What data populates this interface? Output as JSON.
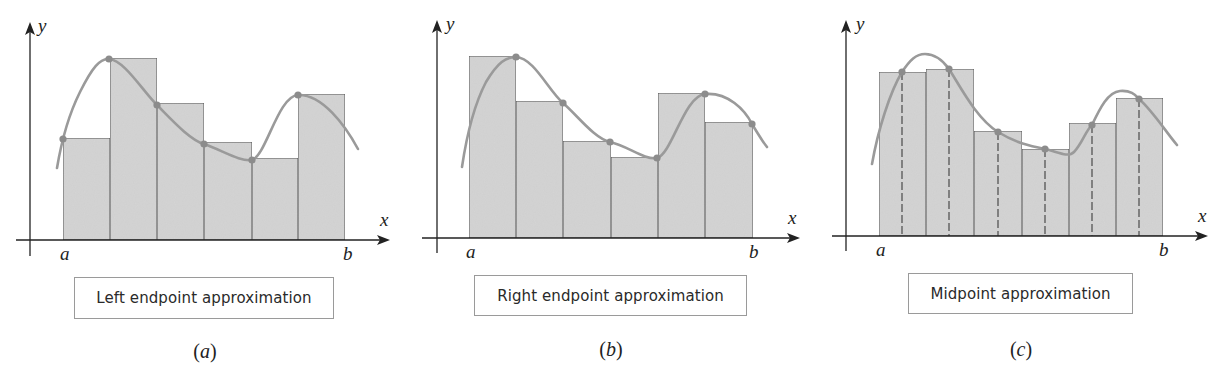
{
  "figure": {
    "panels": [
      {
        "id": "a",
        "caption": "Left endpoint approximation",
        "label_open": "(",
        "label_letter": "a",
        "label_close": ")",
        "axis_labels": {
          "x": "x",
          "y": "y",
          "left_bound": "a",
          "right_bound": "b"
        },
        "method": "left"
      },
      {
        "id": "b",
        "caption": "Right endpoint approximation",
        "label_open": "(",
        "label_letter": "b",
        "label_close": ")",
        "axis_labels": {
          "x": "x",
          "y": "y",
          "left_bound": "a",
          "right_bound": "b"
        },
        "method": "right"
      },
      {
        "id": "c",
        "caption": "Midpoint approximation",
        "label_open": "(",
        "label_letter": "c",
        "label_close": ")",
        "axis_labels": {
          "x": "x",
          "y": "y",
          "left_bound": "a",
          "right_bound": "b"
        },
        "method": "midpoint"
      }
    ],
    "colors": {
      "rect_fill": "#d4d4d4",
      "rect_stroke": "#555555",
      "curve": "#9a9a9a",
      "sample_dot": "#8c8c8c",
      "axis": "#222222",
      "dashed_line": "#555555"
    }
  },
  "geometry": {
    "a": {
      "yaxis_x": 30,
      "yaxis_top": 22,
      "yaxis_bottom": 256,
      "xaxis_y": 240,
      "xaxis_left": 16,
      "xaxis_right": 390,
      "edges": [
        63,
        110,
        157,
        204,
        252,
        298,
        345
      ],
      "heights": [
        138,
        58,
        103,
        142,
        158,
        94
      ],
      "dots": [
        [
          63,
          139
        ],
        [
          109,
          59
        ],
        [
          157,
          105
        ],
        [
          204,
          144
        ],
        [
          252,
          160
        ],
        [
          298,
          95
        ]
      ],
      "curve": "M57,168 C60,150 66,120 80,92 C92,68 100,58 109,59 C124,60 142,90 157,105 C172,120 190,140 204,144 C222,150 240,162 252,160 C266,156 278,96 298,95 C322,94 345,125 358,149",
      "x_label": [
        380,
        226
      ],
      "y_label": [
        38,
        32
      ],
      "a_label": [
        60,
        260
      ],
      "b_label": [
        343,
        260
      ],
      "caption_box": [
        74,
        277,
        260,
        42
      ],
      "panel_label_xy": [
        205,
        340
      ]
    },
    "b": {
      "yaxis_x": 437,
      "yaxis_top": 20,
      "yaxis_bottom": 253,
      "xaxis_y": 238,
      "xaxis_left": 422,
      "xaxis_right": 800,
      "edges": [
        469,
        516,
        563,
        611,
        658,
        705,
        753
      ],
      "heights": [
        56,
        101,
        141,
        157,
        93,
        122
      ],
      "dots": [
        [
          516,
          57
        ],
        [
          563,
          103
        ],
        [
          610,
          142
        ],
        [
          657,
          158
        ],
        [
          705,
          94
        ],
        [
          752,
          124
        ]
      ],
      "curve": "M462,167 C466,140 474,105 486,82 C498,62 506,57 516,57 C534,58 548,90 563,103 C578,116 594,138 610,142 C628,146 644,160 657,158 C672,154 684,96 705,94 C728,92 745,110 752,124 C758,134 763,142 767,147",
      "x_label": [
        788,
        224
      ],
      "y_label": [
        446,
        30
      ],
      "a_label": [
        466,
        258
      ],
      "b_label": [
        749,
        258
      ],
      "caption_box": [
        474,
        275,
        273,
        41
      ],
      "panel_label_xy": [
        611,
        338
      ]
    },
    "c": {
      "yaxis_x": 846,
      "yaxis_top": 20,
      "yaxis_bottom": 251,
      "xaxis_y": 236,
      "xaxis_left": 832,
      "xaxis_right": 1208,
      "edges": [
        879,
        926,
        974,
        1022,
        1069,
        1116,
        1163
      ],
      "heights": [
        72,
        69,
        131,
        149,
        123,
        98
      ],
      "dots": [
        [
          902,
          72
        ],
        [
          949,
          69
        ],
        [
          998,
          132
        ],
        [
          1045,
          149
        ],
        [
          1092,
          125
        ],
        [
          1139,
          99
        ]
      ],
      "curve": "M872,164 C878,130 890,92 902,72 C910,60 916,54 925,54 C936,54 944,62 949,69 C960,86 976,118 998,132 C1016,143 1030,146 1045,149 C1058,152 1068,158 1074,152 C1082,144 1086,130 1092,125 C1100,108 1108,92 1120,91 C1132,90 1136,96 1139,99 C1152,110 1166,132 1177,145",
      "x_label": [
        1198,
        222
      ],
      "y_label": [
        856,
        30
      ],
      "a_label": [
        876,
        256
      ],
      "b_label": [
        1159,
        256
      ],
      "caption_box": [
        908,
        273,
        225,
        41
      ],
      "panel_label_xy": [
        1021,
        338
      ]
    }
  }
}
